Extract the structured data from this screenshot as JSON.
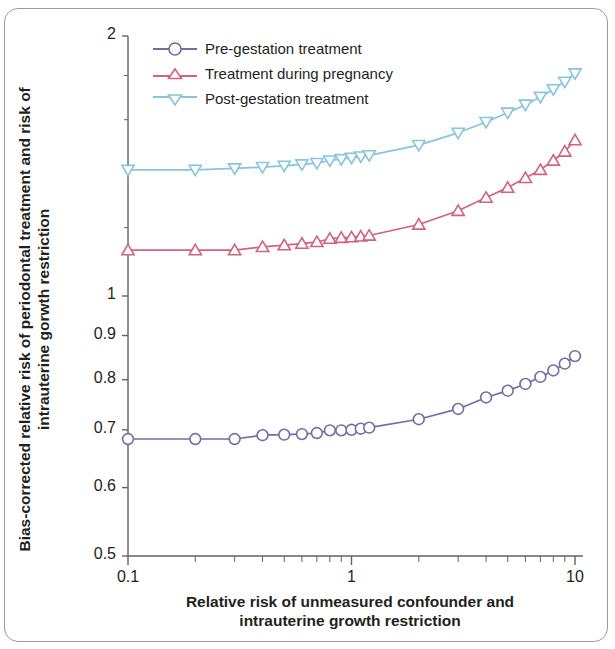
{
  "chart_data": {
    "type": "line",
    "title": "",
    "xlabel": "Relative risk of unmeasured confounder and intrauterine growth restriction",
    "ylabel": "Bias-corrected relative risk of periodontal treatment and risk of intrauterine gorwth restriction",
    "xscale": "log",
    "yscale": "log",
    "xlim": [
      0.1,
      10
    ],
    "ylim": [
      0.5,
      2
    ],
    "grid": false,
    "legend_position": "top-left",
    "xticks": [
      0.1,
      1,
      10
    ],
    "xtick_labels": [
      "0.1",
      "1",
      "10"
    ],
    "yticks": [
      0.5,
      0.6,
      0.7,
      0.8,
      0.9,
      1,
      2
    ],
    "ytick_labels": [
      "0.5",
      "0.6",
      "0.7",
      "0.8",
      "0.9",
      "1",
      "2"
    ],
    "series": [
      {
        "name": "Pre-gestation treatment",
        "color": "#6f6fa6",
        "marker": "circle",
        "x": [
          0.1,
          0.2,
          0.3,
          0.4,
          0.5,
          0.6,
          0.7,
          0.8,
          0.9,
          1.0,
          1.1,
          1.2,
          2.0,
          3.0,
          4.0,
          5.0,
          6.0,
          7.0,
          8.0,
          9.0,
          10.0
        ],
        "y": [
          0.683,
          0.683,
          0.683,
          0.69,
          0.691,
          0.692,
          0.694,
          0.699,
          0.699,
          0.7,
          0.702,
          0.704,
          0.72,
          0.74,
          0.763,
          0.777,
          0.791,
          0.806,
          0.82,
          0.835,
          0.852
        ]
      },
      {
        "name": "Treatment during pregnancy",
        "color": "#d0637f",
        "marker": "triangle-up",
        "x": [
          0.1,
          0.2,
          0.3,
          0.4,
          0.5,
          0.6,
          0.7,
          0.8,
          0.9,
          1.0,
          1.1,
          1.2,
          2.0,
          3.0,
          4.0,
          5.0,
          6.0,
          7.0,
          8.0,
          9.0,
          10.0
        ],
        "y": [
          1.13,
          1.13,
          1.13,
          1.14,
          1.145,
          1.15,
          1.155,
          1.165,
          1.168,
          1.17,
          1.172,
          1.175,
          1.21,
          1.255,
          1.3,
          1.335,
          1.37,
          1.4,
          1.435,
          1.47,
          1.515
        ]
      },
      {
        "name": "Post-gestation treatment",
        "color": "#86c5de",
        "marker": "triangle-down",
        "x": [
          0.1,
          0.2,
          0.3,
          0.4,
          0.5,
          0.6,
          0.7,
          0.8,
          0.9,
          1.0,
          1.1,
          1.2,
          2.0,
          3.0,
          4.0,
          5.0,
          6.0,
          7.0,
          8.0,
          9.0,
          10.0
        ],
        "y": [
          1.4,
          1.4,
          1.405,
          1.41,
          1.415,
          1.42,
          1.425,
          1.435,
          1.44,
          1.445,
          1.45,
          1.455,
          1.495,
          1.545,
          1.59,
          1.63,
          1.665,
          1.7,
          1.735,
          1.77,
          1.81
        ]
      }
    ]
  },
  "legend": {
    "items": [
      {
        "label": "Pre-gestation treatment"
      },
      {
        "label": "Treatment during pregnancy"
      },
      {
        "label": "Post-gestation treatment"
      }
    ]
  },
  "axes": {
    "y_title": "Bias-corrected relative risk of periodontal treatment and risk of intrauterine gorwth restriction",
    "x_title_line1": "Relative risk of unmeasured confounder and",
    "x_title_line2": "intrauterine growth restriction",
    "x_title": "Relative risk of unmeasured confounder and intrauterine growth restriction"
  }
}
